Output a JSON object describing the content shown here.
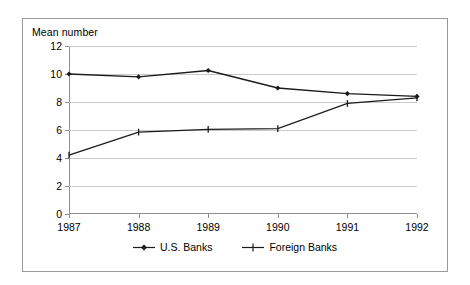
{
  "chart_data": {
    "type": "line",
    "title": "",
    "ylabel": "Mean number",
    "xlabel": "",
    "categories": [
      "1987",
      "1988",
      "1989",
      "1990",
      "1991",
      "1992"
    ],
    "ylim": [
      0,
      12
    ],
    "yticks": [
      0,
      2,
      4,
      6,
      8,
      10,
      12
    ],
    "ytick_labels": [
      "0",
      "2",
      "4",
      "6",
      "8",
      "10",
      "12"
    ],
    "grid": true,
    "legend_position": "bottom-center",
    "series": [
      {
        "name": "U.S. Banks",
        "marker": "diamond",
        "color": "#1a1a1a",
        "values": [
          10.0,
          9.8,
          10.25,
          9.0,
          8.6,
          8.4
        ]
      },
      {
        "name": "Foreign Banks",
        "marker": "plus",
        "color": "#1a1a1a",
        "values": [
          4.2,
          5.85,
          6.05,
          6.1,
          7.9,
          8.3
        ]
      }
    ]
  },
  "legend": {
    "items": [
      {
        "label": "U.S. Banks"
      },
      {
        "label": "Foreign Banks"
      }
    ]
  },
  "colors": {
    "border": "#9a9a9a",
    "axis": "#8f8f8f",
    "grid": "#c9c9c9",
    "line": "#1a1a1a",
    "background": "#ffffff"
  }
}
